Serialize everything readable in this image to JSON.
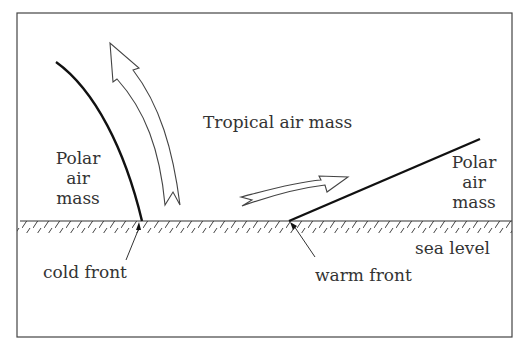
{
  "diagram": {
    "type": "weather fronts cross-section",
    "labels": {
      "tropical": "Tropical air mass",
      "polar_left": [
        "Polar",
        "air",
        "mass"
      ],
      "polar_right": [
        "Polar",
        "air",
        "mass"
      ],
      "sea_level": "sea level",
      "cold_front": "cold front",
      "warm_front": "warm front"
    },
    "colors": {
      "line": "#222222",
      "text": "#333333",
      "background": "#ffffff"
    }
  }
}
